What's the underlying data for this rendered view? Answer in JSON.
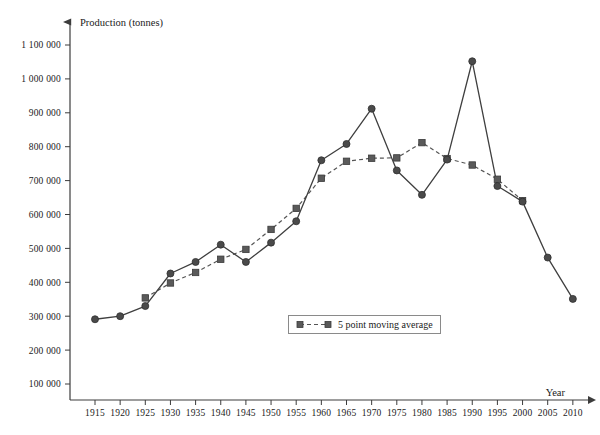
{
  "chart_data": {
    "type": "line",
    "title": "",
    "xlabel": "Year",
    "ylabel": "Production (tonnes)",
    "xlim": [
      1912.5,
      2012.5
    ],
    "ylim": [
      0,
      1150000
    ],
    "grid": false,
    "legend_position": "inside-bottom-center",
    "x": [
      1915,
      1920,
      1925,
      1930,
      1935,
      1940,
      1945,
      1950,
      1955,
      1960,
      1965,
      1970,
      1975,
      1980,
      1985,
      1990,
      1995,
      2000,
      2005,
      2010
    ],
    "y_tick_labels": [
      "100 000",
      "200 000",
      "300 000",
      "400 000",
      "500 000",
      "600 000",
      "700 000",
      "800 000",
      "900 000",
      "1 000 000",
      "1 100 000"
    ],
    "y_tick_values": [
      100000,
      200000,
      300000,
      400000,
      500000,
      600000,
      700000,
      800000,
      900000,
      1000000,
      1100000
    ],
    "x_tick_labels": [
      "1915",
      "1920",
      "1925",
      "1930",
      "1935",
      "1940",
      "1945",
      "1950",
      "1955",
      "1960",
      "1965",
      "1970",
      "1975",
      "1980",
      "1985",
      "1990",
      "1995",
      "2000",
      "2005",
      "2010"
    ],
    "series": [
      {
        "name": "Production",
        "marker": "circle",
        "line_style": "solid",
        "color": "#4a4a4a",
        "x": [
          1915,
          1920,
          1925,
          1930,
          1935,
          1940,
          1945,
          1950,
          1955,
          1960,
          1965,
          1970,
          1975,
          1980,
          1985,
          1990,
          1995,
          2000,
          2005,
          2010
        ],
        "values": [
          291000,
          300000,
          330000,
          426000,
          460000,
          511000,
          460000,
          517000,
          580000,
          760000,
          808000,
          912000,
          730000,
          658000,
          762000,
          1052000,
          684000,
          638000,
          473000,
          351000
        ]
      },
      {
        "name": "5 point moving average",
        "marker": "square",
        "line_style": "dashed",
        "color": "#5a5a5a",
        "x": [
          1925,
          1930,
          1935,
          1940,
          1945,
          1950,
          1955,
          1960,
          1965,
          1970,
          1975,
          1980,
          1985,
          1990,
          1995,
          2000
        ],
        "values": [
          354000,
          398000,
          429000,
          468000,
          497000,
          556000,
          618000,
          707000,
          757000,
          766000,
          767000,
          812000,
          765000,
          746000,
          704000,
          641000
        ]
      }
    ]
  },
  "legend": {
    "label": "5 point moving average"
  },
  "axes": {
    "y_title": "Production (tonnes)",
    "x_title": "Year"
  }
}
